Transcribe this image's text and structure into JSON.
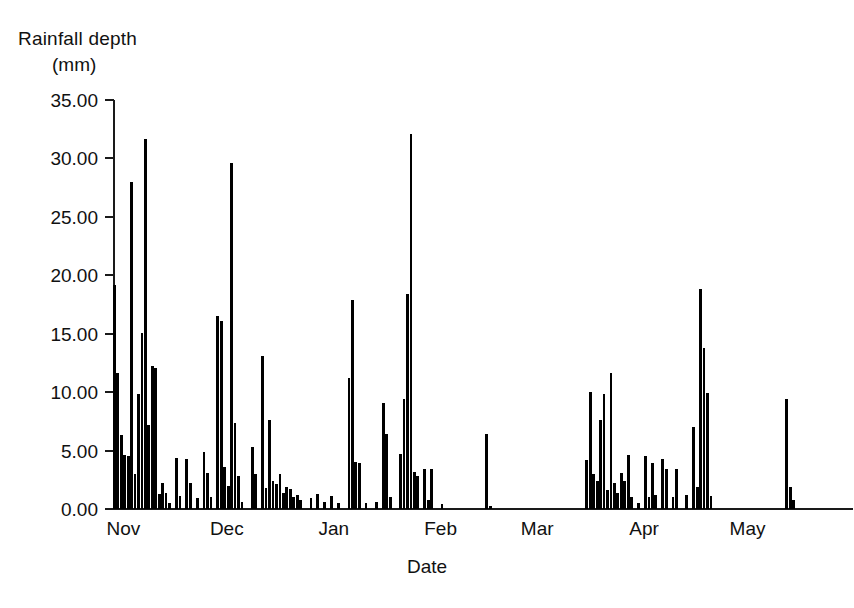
{
  "chart_data": {
    "type": "bar",
    "title": "",
    "ylabel": "Rainfall depth (mm)",
    "ylabel_line1": "Rainfall depth",
    "ylabel_line2": "(mm)",
    "xlabel": "Date",
    "ylim": [
      0,
      35
    ],
    "ytick_labels": [
      "0.00",
      "5.00",
      "10.00",
      "15.00",
      "20.00",
      "25.00",
      "30.00",
      "35.00"
    ],
    "ytick_values": [
      0,
      5,
      10,
      15,
      20,
      25,
      30,
      35
    ],
    "grid": false,
    "legend": null,
    "bar_color": "#000000",
    "axis_color": "#1a1a1a",
    "x_categories": [
      "Nov",
      "Dec",
      "Jan",
      "Feb",
      "Mar",
      "Apr",
      "May"
    ],
    "x_tick_positions_day": [
      4,
      34,
      65,
      96,
      124,
      155,
      185
    ],
    "n_days": 214,
    "series": [
      {
        "name": "Daily rainfall depth",
        "units": "mm",
        "points": [
          {
            "day": 1,
            "value": 19.2
          },
          {
            "day": 2,
            "value": 11.6
          },
          {
            "day": 3,
            "value": 6.3
          },
          {
            "day": 4,
            "value": 4.6
          },
          {
            "day": 5,
            "value": 4.5
          },
          {
            "day": 6,
            "value": 28.0
          },
          {
            "day": 7,
            "value": 3.0
          },
          {
            "day": 8,
            "value": 9.8
          },
          {
            "day": 9,
            "value": 15.1
          },
          {
            "day": 10,
            "value": 31.7
          },
          {
            "day": 11,
            "value": 7.2
          },
          {
            "day": 12,
            "value": 12.2
          },
          {
            "day": 13,
            "value": 12.1
          },
          {
            "day": 14,
            "value": 1.3
          },
          {
            "day": 15,
            "value": 2.2
          },
          {
            "day": 16,
            "value": 1.4
          },
          {
            "day": 17,
            "value": 0.5
          },
          {
            "day": 19,
            "value": 4.4
          },
          {
            "day": 20,
            "value": 1.1
          },
          {
            "day": 22,
            "value": 4.3
          },
          {
            "day": 23,
            "value": 2.2
          },
          {
            "day": 25,
            "value": 0.9
          },
          {
            "day": 27,
            "value": 4.9
          },
          {
            "day": 28,
            "value": 3.1
          },
          {
            "day": 29,
            "value": 1.0
          },
          {
            "day": 31,
            "value": 16.5
          },
          {
            "day": 32,
            "value": 16.1
          },
          {
            "day": 33,
            "value": 3.6
          },
          {
            "day": 34,
            "value": 2.0
          },
          {
            "day": 35,
            "value": 29.6
          },
          {
            "day": 36,
            "value": 7.4
          },
          {
            "day": 37,
            "value": 2.8
          },
          {
            "day": 38,
            "value": 0.6
          },
          {
            "day": 41,
            "value": 5.3
          },
          {
            "day": 42,
            "value": 3.0
          },
          {
            "day": 44,
            "value": 13.1
          },
          {
            "day": 45,
            "value": 1.8
          },
          {
            "day": 46,
            "value": 7.6
          },
          {
            "day": 47,
            "value": 2.4
          },
          {
            "day": 48,
            "value": 2.1
          },
          {
            "day": 49,
            "value": 3.0
          },
          {
            "day": 50,
            "value": 1.4
          },
          {
            "day": 51,
            "value": 1.9
          },
          {
            "day": 52,
            "value": 1.7
          },
          {
            "day": 53,
            "value": 1.0
          },
          {
            "day": 54,
            "value": 1.2
          },
          {
            "day": 55,
            "value": 0.8
          },
          {
            "day": 58,
            "value": 0.9
          },
          {
            "day": 60,
            "value": 1.3
          },
          {
            "day": 62,
            "value": 0.6
          },
          {
            "day": 64,
            "value": 1.1
          },
          {
            "day": 66,
            "value": 0.5
          },
          {
            "day": 69,
            "value": 11.2
          },
          {
            "day": 70,
            "value": 17.9
          },
          {
            "day": 71,
            "value": 4.0
          },
          {
            "day": 72,
            "value": 3.9
          },
          {
            "day": 74,
            "value": 0.5
          },
          {
            "day": 77,
            "value": 0.6
          },
          {
            "day": 79,
            "value": 9.1
          },
          {
            "day": 80,
            "value": 6.4
          },
          {
            "day": 81,
            "value": 1.0
          },
          {
            "day": 84,
            "value": 4.7
          },
          {
            "day": 85,
            "value": 9.4
          },
          {
            "day": 86,
            "value": 18.4
          },
          {
            "day": 87,
            "value": 32.1
          },
          {
            "day": 88,
            "value": 3.2
          },
          {
            "day": 89,
            "value": 2.8
          },
          {
            "day": 91,
            "value": 3.4
          },
          {
            "day": 92,
            "value": 0.8
          },
          {
            "day": 93,
            "value": 3.4
          },
          {
            "day": 96,
            "value": 0.4
          },
          {
            "day": 109,
            "value": 6.4
          },
          {
            "day": 110,
            "value": 0.3
          },
          {
            "day": 138,
            "value": 4.2
          },
          {
            "day": 139,
            "value": 10.0
          },
          {
            "day": 140,
            "value": 3.0
          },
          {
            "day": 141,
            "value": 2.4
          },
          {
            "day": 142,
            "value": 7.6
          },
          {
            "day": 143,
            "value": 9.8
          },
          {
            "day": 144,
            "value": 1.6
          },
          {
            "day": 145,
            "value": 11.6
          },
          {
            "day": 146,
            "value": 2.2
          },
          {
            "day": 147,
            "value": 1.4
          },
          {
            "day": 148,
            "value": 3.1
          },
          {
            "day": 149,
            "value": 2.4
          },
          {
            "day": 150,
            "value": 4.6
          },
          {
            "day": 151,
            "value": 1.0
          },
          {
            "day": 153,
            "value": 0.5
          },
          {
            "day": 155,
            "value": 4.5
          },
          {
            "day": 156,
            "value": 1.0
          },
          {
            "day": 157,
            "value": 3.9
          },
          {
            "day": 158,
            "value": 1.2
          },
          {
            "day": 160,
            "value": 4.3
          },
          {
            "day": 161,
            "value": 3.4
          },
          {
            "day": 163,
            "value": 1.0
          },
          {
            "day": 164,
            "value": 3.4
          },
          {
            "day": 167,
            "value": 1.2
          },
          {
            "day": 169,
            "value": 7.0
          },
          {
            "day": 170,
            "value": 1.9
          },
          {
            "day": 171,
            "value": 18.8
          },
          {
            "day": 172,
            "value": 13.8
          },
          {
            "day": 173,
            "value": 9.9
          },
          {
            "day": 174,
            "value": 1.1
          },
          {
            "day": 196,
            "value": 9.4
          },
          {
            "day": 197,
            "value": 1.9
          },
          {
            "day": 198,
            "value": 0.8
          }
        ]
      }
    ],
    "annotations": []
  }
}
